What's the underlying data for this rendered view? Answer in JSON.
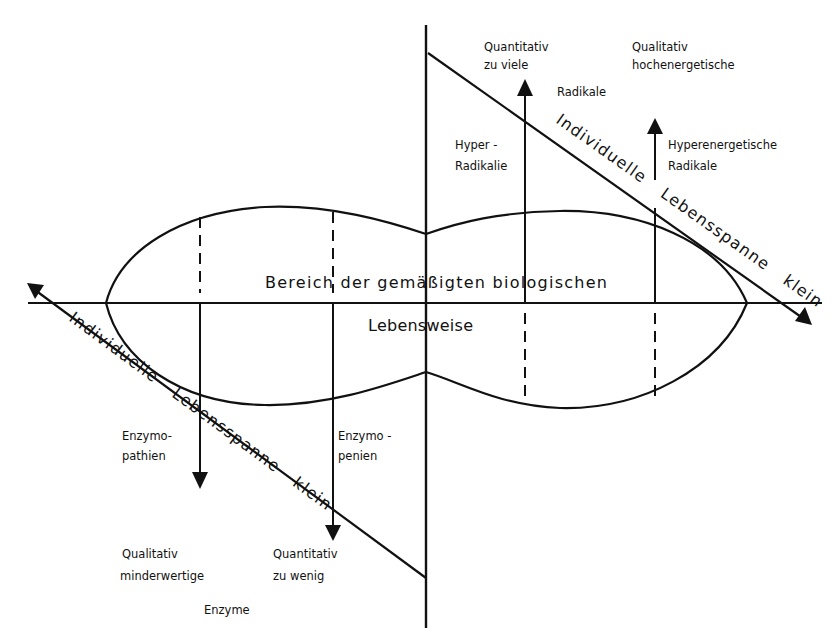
{
  "diagram": {
    "colors": {
      "ink": "#111111",
      "background": "#ffffff"
    },
    "center_region": {
      "line1": "Bereich der gemäßigten biologischen",
      "line2": "Lebensweise"
    },
    "diagonal_upper_right": {
      "label_word1": "Individuelle",
      "label_word2": "Lebensspanne",
      "label_word3": "klein"
    },
    "diagonal_lower_left": {
      "label_word1": "Individuelle",
      "label_word2": "Lebensspanne",
      "label_word3": "klein"
    },
    "upper": {
      "quantitative_heading": {
        "line1": "Quantitativ",
        "line2": "zu viele"
      },
      "qualitative_heading": {
        "line1": "Qualitativ",
        "line2": "hochenergetische"
      },
      "shared_noun": "Radikale",
      "hyper_radikalie": {
        "line1": "Hyper -",
        "line2": "Radikalie"
      },
      "hyperenergetische": {
        "line1": "Hyperenergetische",
        "line2": "Radikale"
      }
    },
    "lower": {
      "enzymopathien": {
        "line1": "Enzymo-",
        "line2": "pathien"
      },
      "enzymopenien": {
        "line1": "Enzymo -",
        "line2": "penien"
      },
      "qualitative_heading": {
        "line1": "Qualitativ",
        "line2": "minderwertige"
      },
      "quantitative_heading": {
        "line1": "Quantitativ",
        "line2": "zu wenig"
      },
      "shared_noun": "Enzyme"
    }
  }
}
